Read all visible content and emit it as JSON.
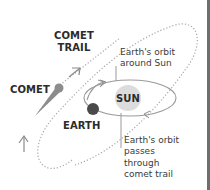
{
  "diagram": {
    "labels": {
      "comet_trail": [
        "COMET",
        "TRAIL"
      ],
      "comet": "COMET",
      "sun": "SUN",
      "earth": "EARTH",
      "earth_orbit_note": [
        "Earth's orbit",
        "around Sun"
      ],
      "crossing_note": [
        "Earth's orbit",
        "passes",
        "through",
        "comet trail"
      ]
    },
    "colors": {
      "sun_fill": "#dcdcdc",
      "earth_fill": "#4a4a4a",
      "comet_fill": "#8c8c8c",
      "orbit_stroke": "#9a9a9a",
      "trail_dots": "#a8a8a8",
      "text": "#2b2b2b",
      "edge_bar": "#6e6e6e"
    }
  }
}
